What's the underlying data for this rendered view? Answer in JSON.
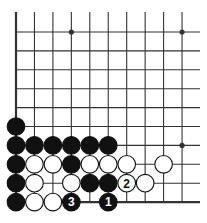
{
  "diagram": {
    "type": "go-board-fragment",
    "corner": "lower-left",
    "columns": 10,
    "rows": 10,
    "colors": {
      "line": "#333333",
      "black_stone": "#111111",
      "white_stone": "#ffffff",
      "stone_outline": "#111111",
      "background": "#ffffff"
    },
    "star_points": [
      {
        "col": 3,
        "row": 0
      },
      {
        "col": 9,
        "row": 0
      },
      {
        "col": 9,
        "row": 6
      }
    ],
    "stones": [
      {
        "col": 0,
        "row": 5,
        "color": "black",
        "label": ""
      },
      {
        "col": 0,
        "row": 6,
        "color": "black",
        "label": ""
      },
      {
        "col": 1,
        "row": 6,
        "color": "black",
        "label": ""
      },
      {
        "col": 2,
        "row": 6,
        "color": "black",
        "label": ""
      },
      {
        "col": 3,
        "row": 6,
        "color": "black",
        "label": ""
      },
      {
        "col": 4,
        "row": 6,
        "color": "black",
        "label": ""
      },
      {
        "col": 5,
        "row": 6,
        "color": "black",
        "label": ""
      },
      {
        "col": 0,
        "row": 7,
        "color": "black",
        "label": ""
      },
      {
        "col": 1,
        "row": 7,
        "color": "white",
        "label": ""
      },
      {
        "col": 2,
        "row": 7,
        "color": "white",
        "label": ""
      },
      {
        "col": 3,
        "row": 7,
        "color": "black",
        "label": ""
      },
      {
        "col": 4,
        "row": 7,
        "color": "white",
        "label": ""
      },
      {
        "col": 5,
        "row": 7,
        "color": "white",
        "label": ""
      },
      {
        "col": 6,
        "row": 7,
        "color": "white",
        "label": ""
      },
      {
        "col": 8,
        "row": 7,
        "color": "white",
        "label": ""
      },
      {
        "col": 0,
        "row": 8,
        "color": "black",
        "label": ""
      },
      {
        "col": 1,
        "row": 8,
        "color": "white",
        "label": ""
      },
      {
        "col": 3,
        "row": 8,
        "color": "white",
        "label": ""
      },
      {
        "col": 4,
        "row": 8,
        "color": "black",
        "label": ""
      },
      {
        "col": 5,
        "row": 8,
        "color": "black",
        "label": ""
      },
      {
        "col": 6,
        "row": 8,
        "color": "white",
        "label": "2"
      },
      {
        "col": 7,
        "row": 8,
        "color": "white",
        "label": ""
      },
      {
        "col": 0,
        "row": 9,
        "color": "black",
        "label": ""
      },
      {
        "col": 1,
        "row": 9,
        "color": "white",
        "label": ""
      },
      {
        "col": 2,
        "row": 9,
        "color": "white",
        "label": ""
      },
      {
        "col": 3,
        "row": 9,
        "color": "black",
        "label": "3"
      },
      {
        "col": 5,
        "row": 9,
        "color": "black",
        "label": "1"
      }
    ]
  }
}
